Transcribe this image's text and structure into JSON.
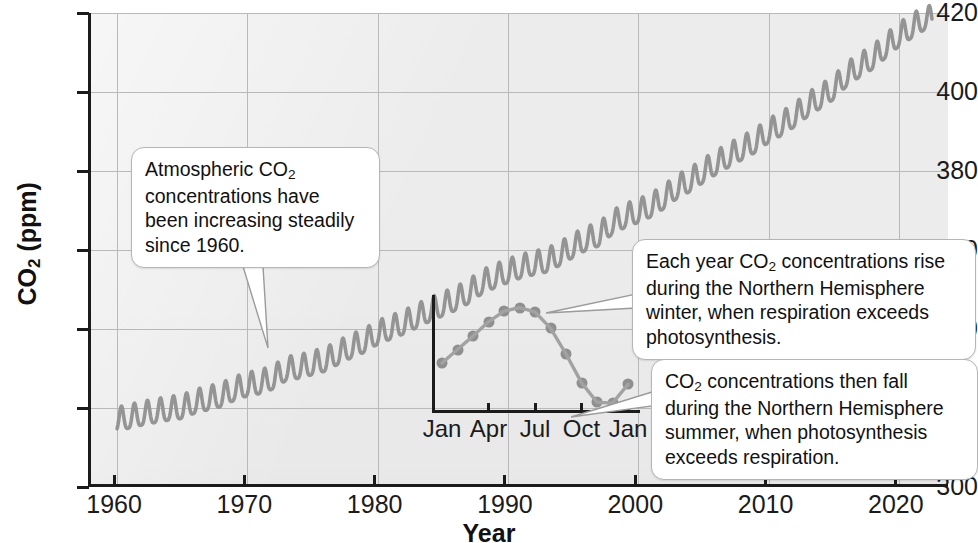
{
  "chart_data": {
    "type": "line",
    "title": "",
    "xlabel": "Year",
    "ylabel": "CO2 (ppm)",
    "ylabel_rich": {
      "text": "CO",
      "sub": "2",
      "suffix": " (ppm)"
    },
    "xlim": [
      1958,
      2024
    ],
    "ylim": [
      300,
      420
    ],
    "ytick_values": [
      300,
      320,
      340,
      360,
      380,
      400,
      420
    ],
    "ytick_labels": [
      "300",
      "320",
      "340",
      "360",
      "380",
      "400",
      "420"
    ],
    "xtick_values": [
      1960,
      1970,
      1980,
      1990,
      2000,
      2010,
      2020
    ],
    "xtick_labels": [
      "1960",
      "1970",
      "1980",
      "1990",
      "2000",
      "2010",
      "2020"
    ],
    "grid": true,
    "legend": "none",
    "series_name": "Atmospheric CO2 concentration (Mauna Loa)",
    "series_color": "#8f8f8f",
    "annual_mean": [
      {
        "year": 1960,
        "ppm": 316.9
      },
      {
        "year": 1961,
        "ppm": 317.6
      },
      {
        "year": 1962,
        "ppm": 318.4
      },
      {
        "year": 1963,
        "ppm": 319.0
      },
      {
        "year": 1964,
        "ppm": 319.6
      },
      {
        "year": 1965,
        "ppm": 320.0
      },
      {
        "year": 1966,
        "ppm": 321.4
      },
      {
        "year": 1967,
        "ppm": 322.2
      },
      {
        "year": 1968,
        "ppm": 323.0
      },
      {
        "year": 1969,
        "ppm": 324.6
      },
      {
        "year": 1970,
        "ppm": 325.7
      },
      {
        "year": 1971,
        "ppm": 326.3
      },
      {
        "year": 1972,
        "ppm": 327.5
      },
      {
        "year": 1973,
        "ppm": 329.7
      },
      {
        "year": 1974,
        "ppm": 330.2
      },
      {
        "year": 1975,
        "ppm": 331.1
      },
      {
        "year": 1976,
        "ppm": 332.0
      },
      {
        "year": 1977,
        "ppm": 333.8
      },
      {
        "year": 1978,
        "ppm": 335.4
      },
      {
        "year": 1979,
        "ppm": 336.8
      },
      {
        "year": 1980,
        "ppm": 338.8
      },
      {
        "year": 1981,
        "ppm": 340.1
      },
      {
        "year": 1982,
        "ppm": 341.4
      },
      {
        "year": 1983,
        "ppm": 343.0
      },
      {
        "year": 1984,
        "ppm": 344.6
      },
      {
        "year": 1985,
        "ppm": 346.0
      },
      {
        "year": 1986,
        "ppm": 347.4
      },
      {
        "year": 1987,
        "ppm": 349.2
      },
      {
        "year": 1988,
        "ppm": 351.6
      },
      {
        "year": 1989,
        "ppm": 353.1
      },
      {
        "year": 1990,
        "ppm": 354.4
      },
      {
        "year": 1991,
        "ppm": 355.6
      },
      {
        "year": 1992,
        "ppm": 356.4
      },
      {
        "year": 1993,
        "ppm": 357.1
      },
      {
        "year": 1994,
        "ppm": 358.8
      },
      {
        "year": 1995,
        "ppm": 360.8
      },
      {
        "year": 1996,
        "ppm": 362.6
      },
      {
        "year": 1997,
        "ppm": 363.7
      },
      {
        "year": 1998,
        "ppm": 366.7
      },
      {
        "year": 1999,
        "ppm": 368.4
      },
      {
        "year": 2000,
        "ppm": 369.6
      },
      {
        "year": 2001,
        "ppm": 371.1
      },
      {
        "year": 2002,
        "ppm": 373.2
      },
      {
        "year": 2003,
        "ppm": 375.8
      },
      {
        "year": 2004,
        "ppm": 377.5
      },
      {
        "year": 2005,
        "ppm": 379.8
      },
      {
        "year": 2006,
        "ppm": 381.9
      },
      {
        "year": 2007,
        "ppm": 383.8
      },
      {
        "year": 2008,
        "ppm": 385.6
      },
      {
        "year": 2009,
        "ppm": 387.4
      },
      {
        "year": 2010,
        "ppm": 389.9
      },
      {
        "year": 2011,
        "ppm": 391.7
      },
      {
        "year": 2012,
        "ppm": 393.9
      },
      {
        "year": 2013,
        "ppm": 396.5
      },
      {
        "year": 2014,
        "ppm": 398.6
      },
      {
        "year": 2015,
        "ppm": 400.8
      },
      {
        "year": 2016,
        "ppm": 404.2
      },
      {
        "year": 2017,
        "ppm": 406.5
      },
      {
        "year": 2018,
        "ppm": 408.5
      },
      {
        "year": 2019,
        "ppm": 411.4
      },
      {
        "year": 2020,
        "ppm": 414.2
      },
      {
        "year": 2021,
        "ppm": 416.4
      },
      {
        "year": 2022,
        "ppm": 418.5
      }
    ],
    "seasonal_amplitude_ppm": 6.0,
    "seasonal_peak_month": 5,
    "seasonal_trough_month": 9.5,
    "inset": {
      "type": "line",
      "title": "",
      "xlabel": "",
      "ylabel": "",
      "xtick_labels": [
        "Jan",
        "Apr",
        "Jul",
        "Oct",
        "Jan"
      ],
      "xtick_positions": [
        0,
        3,
        6,
        9,
        12
      ],
      "point_color": "#8f8f8f",
      "months": [
        "Jan",
        "Feb",
        "Mar",
        "Apr",
        "May",
        "Jun",
        "Jul",
        "Aug",
        "Sep",
        "Oct",
        "Nov",
        "Dec",
        "Jan"
      ],
      "values": [
        -0.4,
        0.35,
        1.1,
        1.9,
        2.5,
        2.7,
        2.45,
        1.55,
        0.1,
        -1.5,
        -2.6,
        -2.65,
        -1.6
      ],
      "ylim": [
        -3.2,
        3.4
      ],
      "note": "relative seasonal departure from annual mean, ppm"
    }
  },
  "annotations": {
    "trend": {
      "id": "callout-trend",
      "lines": [
        "Atmospheric CO",
        "2",
        " concentrations have been increasing steadily since 1960."
      ],
      "text_part1": "Atmospheric CO",
      "text_sub": "2",
      "text_part2": " concentrations have been increasing steadily since 1960.",
      "points_to": "main-curve-1978"
    },
    "rise": {
      "id": "callout-rise",
      "text_part1": "Each year CO",
      "text_sub": "2",
      "text_part2": " concentrations rise during the Northern Hemisphere winter, when respiration exceeds photosynthesis.",
      "points_to": "inset-peak"
    },
    "fall": {
      "id": "callout-fall",
      "text_part1": "CO",
      "text_sub": "2",
      "text_part2": " concentrations then fall during the Northern Hemisphere summer, when photosynthesis exceeds respiration.",
      "points_to": "inset-trough"
    }
  },
  "colors": {
    "plot_background": "#ececec",
    "axis": "#1b1b1b",
    "grid": "#b9b9b9",
    "data": "#8f8f8f",
    "callout_border": "#b5b5b5",
    "callout_background": "#ffffff",
    "text": "#111111"
  }
}
